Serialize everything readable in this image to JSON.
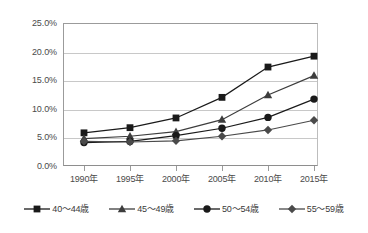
{
  "chart_data": {
    "type": "line",
    "title": "",
    "xlabel": "",
    "ylabel": "",
    "categories": [
      "1990年",
      "1995年",
      "2000年",
      "2005年",
      "2010年",
      "2015年"
    ],
    "ylim": [
      0,
      25
    ],
    "ytick_labels": [
      "0.0%",
      "5.0%",
      "10.0%",
      "15.0%",
      "20.0%",
      "25.0%"
    ],
    "ytick_values": [
      0,
      5,
      10,
      15,
      20,
      25
    ],
    "grid": true,
    "legend_position": "bottom",
    "series": [
      {
        "name": "40〜44歳",
        "marker": "square",
        "color": "#1a1a1a",
        "values": [
          5.8,
          6.7,
          8.4,
          12.0,
          17.3,
          19.2
        ]
      },
      {
        "name": "45〜49歳",
        "marker": "triangle",
        "color": "#3d3d3d",
        "values": [
          4.8,
          5.2,
          6.0,
          8.1,
          12.4,
          15.8
        ]
      },
      {
        "name": "50〜54歳",
        "marker": "circle",
        "color": "#1a1a1a",
        "values": [
          4.1,
          4.3,
          5.3,
          6.6,
          8.5,
          11.7
        ]
      },
      {
        "name": "55〜59歳",
        "marker": "diamond",
        "color": "#4a4a4a",
        "values": [
          4.3,
          4.2,
          4.4,
          5.2,
          6.3,
          8.0
        ]
      }
    ]
  },
  "style": {
    "background": "#ffffff",
    "gridline_color": "#c8c8c8",
    "axis_color": "#9b9b9b",
    "text_color": "#4a4a4a"
  }
}
